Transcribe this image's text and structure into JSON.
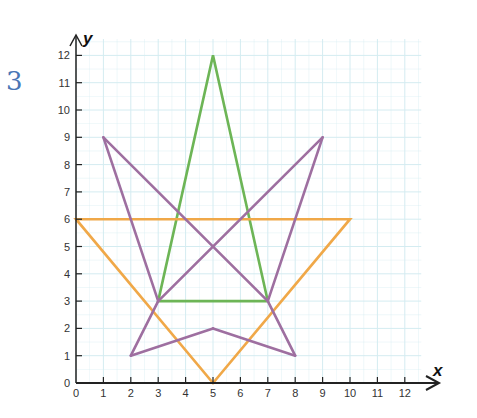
{
  "exercise": {
    "number": "3"
  },
  "chart_data": {
    "type": "line",
    "title": "",
    "xlabel": "x",
    "ylabel": "y",
    "xlim": [
      0,
      12
    ],
    "ylim": [
      0,
      12
    ],
    "grid": true,
    "x_ticks": [
      "0",
      "1",
      "2",
      "3",
      "4",
      "5",
      "6",
      "7",
      "8",
      "9",
      "10",
      "11",
      "12"
    ],
    "y_ticks": [
      "0",
      "1",
      "2",
      "3",
      "4",
      "5",
      "6",
      "7",
      "8",
      "9",
      "10",
      "11",
      "12"
    ],
    "series": [
      {
        "name": "green triangle",
        "color": "#6db556",
        "closed": true,
        "points": [
          [
            3,
            3
          ],
          [
            5,
            12
          ],
          [
            7,
            3
          ]
        ]
      },
      {
        "name": "orange triangle",
        "color": "#f0a848",
        "closed": true,
        "points": [
          [
            0,
            6
          ],
          [
            10,
            6
          ],
          [
            5,
            0
          ]
        ]
      },
      {
        "name": "purple figure",
        "color": "#9e6fa0",
        "closed": false,
        "segments": [
          [
            [
              1,
              9
            ],
            [
              7,
              3
            ]
          ],
          [
            [
              7,
              3
            ],
            [
              8,
              1
            ]
          ],
          [
            [
              8,
              1
            ],
            [
              5,
              2
            ]
          ],
          [
            [
              5,
              2
            ],
            [
              2,
              1
            ]
          ],
          [
            [
              2,
              1
            ],
            [
              3,
              3
            ]
          ],
          [
            [
              3,
              3
            ],
            [
              9,
              9
            ]
          ],
          [
            [
              9,
              9
            ],
            [
              7,
              3
            ]
          ],
          [
            [
              1,
              9
            ],
            [
              3,
              3
            ]
          ]
        ]
      }
    ]
  },
  "colors": {
    "grid": "#d4ecf1",
    "axis": "#222222"
  }
}
